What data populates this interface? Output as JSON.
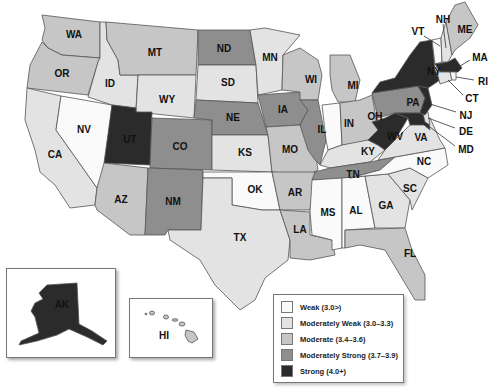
{
  "colors": {
    "weak": "#fafafa",
    "moderately_weak": "#e3e3e3",
    "moderate": "#c6c6c6",
    "moderately_strong": "#8e8e8e",
    "strong": "#2b2b2b"
  },
  "legend": {
    "items": [
      {
        "key": "weak",
        "label": "Weak (3.0>)"
      },
      {
        "key": "moderately_weak",
        "label": "Moderately Weak (3.0–3.3)"
      },
      {
        "key": "moderate",
        "label": "Moderate (3.4–3.6)"
      },
      {
        "key": "moderately_strong",
        "label": "Moderately Strong (3.7–3.9)"
      },
      {
        "key": "strong",
        "label": "Strong (4.0+)"
      }
    ]
  },
  "states": {
    "WA": {
      "label": "WA",
      "category": "moderate"
    },
    "OR": {
      "label": "OR",
      "category": "moderate"
    },
    "CA": {
      "label": "CA",
      "category": "moderately_weak"
    },
    "ID": {
      "label": "ID",
      "category": "moderately_weak"
    },
    "NV": {
      "label": "NV",
      "category": "weak"
    },
    "MT": {
      "label": "MT",
      "category": "moderate"
    },
    "WY": {
      "label": "WY",
      "category": "moderately_weak"
    },
    "UT": {
      "label": "UT",
      "category": "strong"
    },
    "AZ": {
      "label": "AZ",
      "category": "moderate"
    },
    "CO": {
      "label": "CO",
      "category": "moderately_strong"
    },
    "NM": {
      "label": "NM",
      "category": "moderately_strong"
    },
    "ND": {
      "label": "ND",
      "category": "moderately_strong"
    },
    "SD": {
      "label": "SD",
      "category": "moderately_weak"
    },
    "NE": {
      "label": "NE",
      "category": "moderately_strong"
    },
    "KS": {
      "label": "KS",
      "category": "moderately_weak"
    },
    "OK": {
      "label": "OK",
      "category": "weak"
    },
    "TX": {
      "label": "TX",
      "category": "moderately_weak"
    },
    "MN": {
      "label": "MN",
      "category": "moderately_weak"
    },
    "IA": {
      "label": "IA",
      "category": "moderately_strong"
    },
    "MO": {
      "label": "MO",
      "category": "moderate"
    },
    "AR": {
      "label": "AR",
      "category": "moderate"
    },
    "LA": {
      "label": "LA",
      "category": "moderate"
    },
    "WI": {
      "label": "WI",
      "category": "moderate"
    },
    "IL": {
      "label": "IL",
      "category": "moderately_strong"
    },
    "MI": {
      "label": "MI",
      "category": "moderate"
    },
    "IN": {
      "label": "IN",
      "category": "weak"
    },
    "OH": {
      "label": "OH",
      "category": "moderate"
    },
    "KY": {
      "label": "KY",
      "category": "moderately_weak"
    },
    "TN": {
      "label": "TN",
      "category": "moderately_strong"
    },
    "MS": {
      "label": "MS",
      "category": "weak"
    },
    "AL": {
      "label": "AL",
      "category": "weak"
    },
    "GA": {
      "label": "GA",
      "category": "moderately_weak"
    },
    "FL": {
      "label": "FL",
      "category": "moderate"
    },
    "SC": {
      "label": "SC",
      "category": "moderately_weak"
    },
    "NC": {
      "label": "NC",
      "category": "weak"
    },
    "VA": {
      "label": "VA",
      "category": "moderately_weak"
    },
    "WV": {
      "label": "WV",
      "category": "strong"
    },
    "PA": {
      "label": "PA",
      "category": "moderately_strong"
    },
    "NY": {
      "label": "NY",
      "category": "strong"
    },
    "VT": {
      "label": "VT",
      "category": "weak"
    },
    "NH": {
      "label": "NH",
      "category": "moderately_weak"
    },
    "ME": {
      "label": "ME",
      "category": "moderate"
    },
    "MA": {
      "label": "MA",
      "category": "strong"
    },
    "RI": {
      "label": "RI",
      "category": "weak"
    },
    "CT": {
      "label": "CT",
      "category": "moderately_weak"
    },
    "NJ": {
      "label": "NJ",
      "category": "strong"
    },
    "DE": {
      "label": "DE",
      "category": "moderately_weak"
    },
    "MD": {
      "label": "MD",
      "category": "strong"
    },
    "AK": {
      "label": "AK",
      "category": "strong"
    },
    "HI": {
      "label": "HI",
      "category": "moderate"
    }
  }
}
